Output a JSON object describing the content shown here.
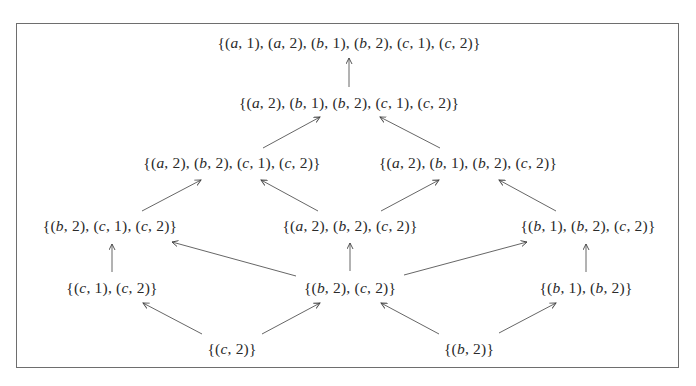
{
  "diagram": {
    "type": "hasse-diagram",
    "colors": {
      "text": "#2a2a2a",
      "edge": "#555555",
      "frame": "#6e6e6e",
      "background": "#ffffff"
    },
    "nodes": [
      {
        "id": "n_all",
        "label": "{(a,1),(a,2),(b,1),(b,2),(c,1),(c,2)}",
        "x": 349,
        "y": 43
      },
      {
        "id": "n_5",
        "label": "{(a,2),(b,1),(b,2),(c,1),(c,2)}",
        "x": 349,
        "y": 103
      },
      {
        "id": "n_4L",
        "label": "{(a,2),(b,2),(c,1),(c,2)}",
        "x": 232,
        "y": 163
      },
      {
        "id": "n_4R",
        "label": "{(a,2),(b,1),(b,2),(c,2)}",
        "x": 468,
        "y": 163
      },
      {
        "id": "n_3L",
        "label": "{(b,2),(c,1),(c,2)}",
        "x": 110,
        "y": 226
      },
      {
        "id": "n_3M",
        "label": "{(a,2),(b,2),(c,2)}",
        "x": 350,
        "y": 226
      },
      {
        "id": "n_3R",
        "label": "{(b,1),(b,2),(c,2)}",
        "x": 588,
        "y": 226
      },
      {
        "id": "n_2L",
        "label": "{(c,1),(c,2)}",
        "x": 112,
        "y": 288
      },
      {
        "id": "n_2M",
        "label": "{(b,2),(c,2)}",
        "x": 350,
        "y": 288
      },
      {
        "id": "n_2R",
        "label": "{(b,1),(b,2)}",
        "x": 586,
        "y": 288
      },
      {
        "id": "n_1L",
        "label": "{(c,2)}",
        "x": 232,
        "y": 349
      },
      {
        "id": "n_1R",
        "label": "{(b,2)}",
        "x": 469,
        "y": 349
      }
    ],
    "edges": [
      {
        "from": "n_5",
        "to": "n_all",
        "x1": 349,
        "y1": 87,
        "x2": 349,
        "y2": 58
      },
      {
        "from": "n_4L",
        "to": "n_5",
        "x1": 263,
        "y1": 148,
        "x2": 320,
        "y2": 117
      },
      {
        "from": "n_4R",
        "to": "n_5",
        "x1": 440,
        "y1": 148,
        "x2": 380,
        "y2": 117
      },
      {
        "from": "n_3L",
        "to": "n_4L",
        "x1": 142,
        "y1": 211,
        "x2": 201,
        "y2": 180
      },
      {
        "from": "n_3M",
        "to": "n_4L",
        "x1": 318,
        "y1": 211,
        "x2": 261,
        "y2": 180
      },
      {
        "from": "n_3M",
        "to": "n_4R",
        "x1": 381,
        "y1": 211,
        "x2": 439,
        "y2": 180
      },
      {
        "from": "n_3R",
        "to": "n_4R",
        "x1": 556,
        "y1": 211,
        "x2": 499,
        "y2": 180
      },
      {
        "from": "n_2L",
        "to": "n_3L",
        "x1": 112,
        "y1": 272,
        "x2": 112,
        "y2": 244
      },
      {
        "from": "n_2M",
        "to": "n_3L",
        "x1": 296,
        "y1": 276,
        "x2": 172,
        "y2": 242
      },
      {
        "from": "n_2M",
        "to": "n_3M",
        "x1": 350,
        "y1": 271,
        "x2": 350,
        "y2": 243
      },
      {
        "from": "n_2M",
        "to": "n_3R",
        "x1": 404,
        "y1": 275,
        "x2": 527,
        "y2": 242
      },
      {
        "from": "n_2R",
        "to": "n_3R",
        "x1": 586,
        "y1": 272,
        "x2": 586,
        "y2": 244
      },
      {
        "from": "n_1L",
        "to": "n_2L",
        "x1": 202,
        "y1": 334,
        "x2": 143,
        "y2": 303
      },
      {
        "from": "n_1L",
        "to": "n_2M",
        "x1": 262,
        "y1": 334,
        "x2": 320,
        "y2": 303
      },
      {
        "from": "n_1R",
        "to": "n_2M",
        "x1": 439,
        "y1": 334,
        "x2": 381,
        "y2": 303
      },
      {
        "from": "n_1R",
        "to": "n_2R",
        "x1": 499,
        "y1": 333,
        "x2": 556,
        "y2": 303
      }
    ]
  }
}
